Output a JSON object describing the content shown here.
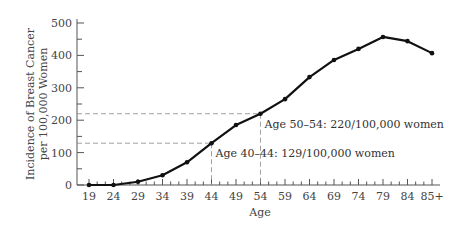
{
  "chart_data": {
    "type": "line",
    "title": "",
    "xlabel": "Age",
    "ylabel": "Incidence of Breast Cancer per 100,000 Women",
    "ylabel_lines": [
      "Incidence of Breast Cancer",
      "per 100,000 Women"
    ],
    "categories": [
      "19",
      "24",
      "29",
      "34",
      "39",
      "44",
      "49",
      "54",
      "59",
      "64",
      "69",
      "74",
      "79",
      "84",
      "85+"
    ],
    "series": [
      {
        "name": "Incidence",
        "values": [
          0,
          0,
          10,
          30,
          70,
          129,
          185,
          220,
          265,
          333,
          386,
          420,
          457,
          444,
          407
        ]
      }
    ],
    "ylim": [
      0,
      500
    ],
    "yticks": [
      0,
      100,
      200,
      300,
      400,
      500
    ],
    "grid": false,
    "legend": null,
    "annotations": [
      {
        "text": "Age 40–44: 129/100,000 women",
        "category_index": 5,
        "value": 129
      },
      {
        "text": "Age 50–54: 220/100,000 women",
        "category_index": 7,
        "value": 220
      }
    ]
  },
  "style": {
    "line_color": "#111111",
    "axis_color": "#555555",
    "guide_color": "#888888"
  }
}
